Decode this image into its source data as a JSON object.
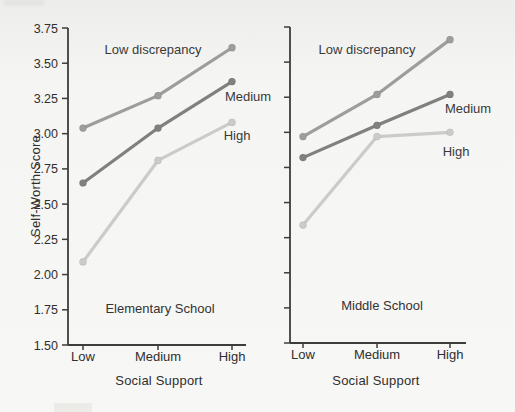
{
  "chart_data": {
    "type": "line",
    "ylabel": "Self-Worth Score",
    "ylim": [
      1.5,
      3.75
    ],
    "ytick_step": 0.25,
    "ytick_decimals": 2,
    "grid": false,
    "legend": "inline-annotations",
    "axis_color": "#3d3d3d",
    "text_color": "#2f2f2f",
    "panels": [
      {
        "title": "Elementary School",
        "xlabel": "Social Support",
        "categories": [
          "Low",
          "Medium",
          "High"
        ],
        "series": [
          {
            "name": "Low discrepancy",
            "values": [
              3.04,
              3.27,
              3.61
            ],
            "color": "#9d9d9d"
          },
          {
            "name": "Medium",
            "values": [
              2.65,
              3.04,
              3.37
            ],
            "color": "#808080"
          },
          {
            "name": "High",
            "values": [
              2.09,
              2.81,
              3.08
            ],
            "color": "#cbcbcb"
          }
        ]
      },
      {
        "title": "Middle School",
        "xlabel": "Social Support",
        "categories": [
          "Low",
          "Medium",
          "High"
        ],
        "series": [
          {
            "name": "Low discrepancy",
            "values": [
              2.97,
              3.27,
              3.66
            ],
            "color": "#9d9d9d"
          },
          {
            "name": "Medium",
            "values": [
              2.82,
              3.05,
              3.27
            ],
            "color": "#808080"
          },
          {
            "name": "High",
            "values": [
              2.34,
              2.97,
              3.0
            ],
            "color": "#cbcbcb"
          }
        ]
      }
    ]
  }
}
